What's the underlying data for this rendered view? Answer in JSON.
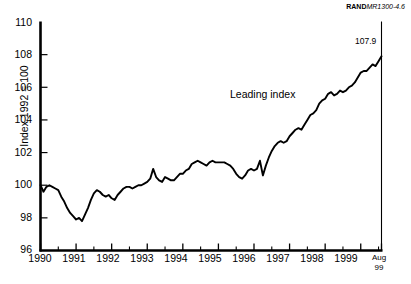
{
  "figure": {
    "credit_bold": "RAND",
    "credit_italic": "MR1300-4.6",
    "ylabel": "Index 1992 = 100",
    "series_annotation": "Leading index",
    "endpoint_label": "107.9",
    "ytick_labels": [
      "110",
      "108",
      "106",
      "104",
      "102",
      "100",
      "98",
      "96"
    ],
    "xtick_labels": [
      "1990",
      "1991",
      "1992",
      "1993",
      "1994",
      "1995",
      "1996",
      "1997",
      "1998",
      "1999"
    ],
    "xtick_end_line1": "Aug",
    "xtick_end_line2": "99",
    "colors": {
      "background": "#ffffff",
      "line": "#000000",
      "axis": "#000000",
      "text": "#000000"
    }
  },
  "chart_data": {
    "type": "line",
    "title": "",
    "subtitle": "",
    "xlabel": "",
    "ylabel": "Index 1992 = 100",
    "xlim": [
      "1990-01",
      "1999-08"
    ],
    "ylim": [
      96,
      110
    ],
    "yticks": [
      96,
      98,
      100,
      102,
      104,
      106,
      108,
      110
    ],
    "ytick_step": 2,
    "xticks": [
      1990,
      1991,
      1992,
      1993,
      1994,
      1995,
      1996,
      1997,
      1998,
      1999
    ],
    "minor_xticks": "half-year",
    "grid": false,
    "legend": "none",
    "annotations": [
      {
        "text": "Leading index",
        "x": "1996-02",
        "y": 104.6
      },
      {
        "text": "107.9",
        "x": "1999-08",
        "y": 108.6
      }
    ],
    "series": [
      {
        "name": "Leading index",
        "color": "#000000",
        "final_value": 107.9,
        "x": [
          "1990-01",
          "1990-02",
          "1990-03",
          "1990-04",
          "1990-05",
          "1990-06",
          "1990-07",
          "1990-08",
          "1990-09",
          "1990-10",
          "1990-11",
          "1990-12",
          "1991-01",
          "1991-02",
          "1991-03",
          "1991-04",
          "1991-05",
          "1991-06",
          "1991-07",
          "1991-08",
          "1991-09",
          "1991-10",
          "1991-11",
          "1991-12",
          "1992-01",
          "1992-02",
          "1992-03",
          "1992-04",
          "1992-05",
          "1992-06",
          "1992-07",
          "1992-08",
          "1992-09",
          "1992-10",
          "1992-11",
          "1992-12",
          "1993-01",
          "1993-02",
          "1993-03",
          "1993-04",
          "1993-05",
          "1993-06",
          "1993-07",
          "1993-08",
          "1993-09",
          "1993-10",
          "1993-11",
          "1993-12",
          "1994-01",
          "1994-02",
          "1994-03",
          "1994-04",
          "1994-05",
          "1994-06",
          "1994-07",
          "1994-08",
          "1994-09",
          "1994-10",
          "1994-11",
          "1994-12",
          "1995-01",
          "1995-02",
          "1995-03",
          "1995-04",
          "1995-05",
          "1995-06",
          "1995-07",
          "1995-08",
          "1995-09",
          "1995-10",
          "1995-11",
          "1995-12",
          "1996-01",
          "1996-02",
          "1996-03",
          "1996-04",
          "1996-05",
          "1996-06",
          "1996-07",
          "1996-08",
          "1996-09",
          "1996-10",
          "1996-11",
          "1996-12",
          "1997-01",
          "1997-02",
          "1997-03",
          "1997-04",
          "1997-05",
          "1997-06",
          "1997-07",
          "1997-08",
          "1997-09",
          "1997-10",
          "1997-11",
          "1997-12",
          "1998-01",
          "1998-02",
          "1998-03",
          "1998-04",
          "1998-05",
          "1998-06",
          "1998-07",
          "1998-08",
          "1998-09",
          "1998-10",
          "1998-11",
          "1998-12",
          "1999-01",
          "1999-02",
          "1999-03",
          "1999-04",
          "1999-05",
          "1999-06",
          "1999-07",
          "1999-08"
        ],
        "values": [
          100.0,
          99.6,
          99.9,
          100.0,
          99.9,
          99.8,
          99.7,
          99.3,
          99.0,
          98.6,
          98.3,
          98.1,
          97.9,
          98.0,
          97.8,
          98.2,
          98.6,
          99.1,
          99.5,
          99.7,
          99.6,
          99.4,
          99.3,
          99.4,
          99.2,
          99.1,
          99.4,
          99.6,
          99.8,
          99.9,
          99.9,
          99.8,
          99.9,
          100.0,
          100.0,
          100.1,
          100.2,
          100.4,
          101.0,
          100.5,
          100.3,
          100.2,
          100.5,
          100.4,
          100.3,
          100.3,
          100.5,
          100.7,
          100.7,
          100.9,
          101.0,
          101.3,
          101.4,
          101.5,
          101.4,
          101.3,
          101.2,
          101.4,
          101.5,
          101.4,
          101.4,
          101.4,
          101.4,
          101.3,
          101.2,
          101.0,
          100.7,
          100.5,
          100.4,
          100.6,
          100.9,
          101.0,
          100.9,
          101.0,
          101.5,
          100.6,
          101.2,
          101.7,
          102.1,
          102.4,
          102.6,
          102.7,
          102.6,
          102.7,
          103.0,
          103.2,
          103.4,
          103.5,
          103.4,
          103.7,
          104.0,
          104.3,
          104.4,
          104.6,
          105.0,
          105.2,
          105.3,
          105.6,
          105.7,
          105.5,
          105.6,
          105.8,
          105.7,
          105.8,
          106.0,
          106.1,
          106.3,
          106.6,
          106.9,
          107.0,
          107.0,
          107.2,
          107.4,
          107.3,
          107.6,
          107.9
        ]
      }
    ]
  }
}
